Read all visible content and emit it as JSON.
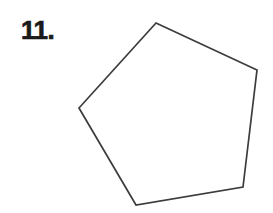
{
  "figure": {
    "label": "11.",
    "background_color": "#ffffff",
    "label_color": "#1a1a1a"
  },
  "shape": {
    "name": "pentagon",
    "sides": 5,
    "description": "irregular convex pentagon outline",
    "stroke_color": "#3c3c3c",
    "fill_color": "#ffffff",
    "stroke_width": 1.7,
    "points": "156,23 257,70 243,187 136,205 79,108",
    "vertices": [
      {
        "name": "top",
        "x": 156,
        "y": 23
      },
      {
        "name": "right",
        "x": 257,
        "y": 70
      },
      {
        "name": "bottom-right",
        "x": 243,
        "y": 187
      },
      {
        "name": "bottom-left",
        "x": 136,
        "y": 205
      },
      {
        "name": "left",
        "x": 79,
        "y": 108
      }
    ]
  }
}
